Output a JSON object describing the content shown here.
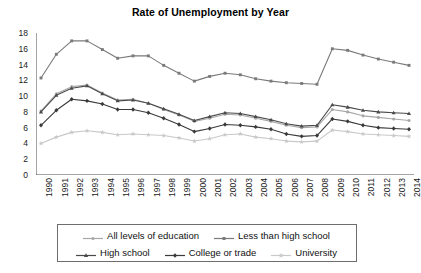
{
  "chart_data": {
    "type": "line",
    "title": "Rate of Unemployment by Year",
    "xlabel": "",
    "ylabel": "",
    "ylim": [
      0,
      18
    ],
    "ytick_step": 2,
    "yticks": [
      0,
      2,
      4,
      6,
      8,
      10,
      12,
      14,
      16,
      18
    ],
    "grid": false,
    "legend_position": "bottom",
    "categories": [
      "1990",
      "1991",
      "1992",
      "1993",
      "1994",
      "1995",
      "1996",
      "1997",
      "1998",
      "1999",
      "2000",
      "2001",
      "2002",
      "2003",
      "2004",
      "2005",
      "2006",
      "2007",
      "2008",
      "2009",
      "2010",
      "2011",
      "2012",
      "2013",
      "2014"
    ],
    "series": [
      {
        "name": "All levels of education",
        "marker": "circle",
        "color": "#a8a8a8",
        "values": [
          8.1,
          10.3,
          11.2,
          11.4,
          10.4,
          9.5,
          9.6,
          9.1,
          8.3,
          7.6,
          6.8,
          7.2,
          7.7,
          7.6,
          7.2,
          6.8,
          6.3,
          6.0,
          6.1,
          8.3,
          8.0,
          7.5,
          7.3,
          7.1,
          6.9
        ]
      },
      {
        "name": "Less than high school",
        "marker": "square",
        "color": "#7a7a7a",
        "values": [
          12.3,
          15.3,
          17.0,
          17.0,
          15.9,
          14.8,
          15.1,
          15.1,
          13.9,
          12.9,
          11.9,
          12.5,
          12.9,
          12.7,
          12.2,
          11.9,
          11.7,
          11.6,
          11.5,
          16.0,
          15.8,
          15.2,
          14.7,
          14.3,
          13.9
        ]
      },
      {
        "name": "High school",
        "marker": "triangle",
        "color": "#4a4a4a",
        "values": [
          8.0,
          10.1,
          11.0,
          11.3,
          10.3,
          9.4,
          9.5,
          9.1,
          8.4,
          7.7,
          6.9,
          7.4,
          7.9,
          7.8,
          7.4,
          7.0,
          6.5,
          6.2,
          6.3,
          8.9,
          8.6,
          8.2,
          8.0,
          7.9,
          7.8
        ]
      },
      {
        "name": "College or trade",
        "marker": "diamond",
        "color": "#3a3a3a",
        "values": [
          6.3,
          8.2,
          9.6,
          9.4,
          9.0,
          8.3,
          8.3,
          7.9,
          7.2,
          6.4,
          5.5,
          5.9,
          6.4,
          6.3,
          6.1,
          5.8,
          5.2,
          4.9,
          5.0,
          7.1,
          6.8,
          6.3,
          6.0,
          5.9,
          5.8
        ]
      },
      {
        "name": "University",
        "marker": "star",
        "color": "#c9c9c9",
        "values": [
          4.0,
          4.8,
          5.4,
          5.6,
          5.4,
          5.1,
          5.2,
          5.1,
          5.0,
          4.7,
          4.3,
          4.6,
          5.1,
          5.2,
          4.8,
          4.6,
          4.3,
          4.2,
          4.3,
          5.7,
          5.5,
          5.2,
          5.1,
          5.0,
          4.9
        ]
      }
    ]
  },
  "axes": {
    "y_min_label": "0",
    "y_max_label": "18"
  },
  "legend": {
    "rows": [
      [
        "All levels of education",
        "Less than high school"
      ],
      [
        "High school",
        "College or trade",
        "University"
      ]
    ]
  }
}
